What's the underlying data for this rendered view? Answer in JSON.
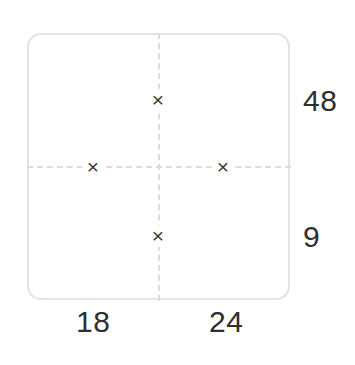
{
  "puzzle": {
    "type": "diamond-multiplication-grid",
    "operator_symbol": "×",
    "cells": [
      {
        "position": "top",
        "name": "cell-top",
        "value": "",
        "operator": "×"
      },
      {
        "position": "left",
        "name": "cell-left",
        "value": "",
        "operator": "×"
      },
      {
        "position": "right",
        "name": "cell-right",
        "value": "",
        "operator": "×"
      },
      {
        "position": "bottom",
        "name": "cell-bottom",
        "value": "",
        "operator": "×"
      }
    ],
    "labels": {
      "right_top": "48",
      "right_bottom": "9",
      "bottom_left": "18",
      "bottom_right": "24"
    },
    "colors": {
      "box_border": "#e3e3e3",
      "divider": "#dcdcdc",
      "operator_text": "#3a3a3a",
      "label_text": "#2f2f2f",
      "background": "#ffffff"
    }
  }
}
